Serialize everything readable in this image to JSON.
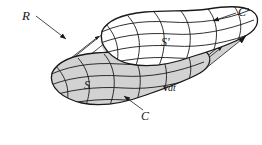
{
  "figure": {
    "background_color": "#ffffff",
    "ink_color": "#1a1a1a",
    "shade_color": "#d2d2d2",
    "labels": {
      "region": "R",
      "curve_initial": "C",
      "curve_final": "C′",
      "surface_initial": "S",
      "surface_final": "S′",
      "displacement_vector": "v",
      "displacement_differential": "dt"
    },
    "annotations": [
      {
        "name": "region-label",
        "text": "R",
        "target": "shaded ruled band",
        "leader": "arrow pointing down-right"
      },
      {
        "name": "curve-final-label",
        "text": "C′",
        "target": "upper rim curve",
        "leader": "arrow pointing left"
      },
      {
        "name": "surface-final-label",
        "text": "S′",
        "target": "upper capped surface",
        "leader": "none"
      },
      {
        "name": "surface-initial-label",
        "text": "S",
        "target": "lower capped surface",
        "leader": "none"
      },
      {
        "name": "curve-initial-label",
        "text": "C",
        "target": "lower rim curve",
        "leader": "arrow pointing up-left"
      },
      {
        "name": "displacement-label",
        "text": "v dt",
        "target": "ruling direction",
        "leader": "none"
      }
    ]
  }
}
